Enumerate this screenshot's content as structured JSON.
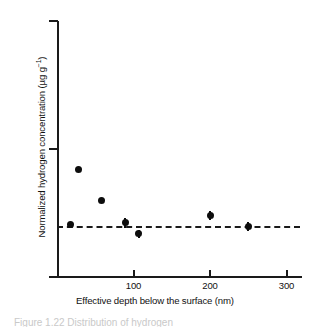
{
  "figure": {
    "caption_fragment": "Figure 1.22 Distribution of hydrogen"
  },
  "axes": {
    "y_ticks": [
      {
        "label_base": "10",
        "label_exp": "2",
        "value": 100
      },
      {
        "label_base": "10",
        "label_exp": "3",
        "value": 1000
      },
      {
        "label_base": "10",
        "label_exp": "4",
        "value": 10000
      }
    ],
    "x_ticks": [
      {
        "label": "100",
        "value": 100
      },
      {
        "label": "200",
        "value": 200
      },
      {
        "label": "300",
        "value": 300
      }
    ]
  },
  "chart_data": {
    "type": "scatter",
    "title": "",
    "xlabel": "Effective depth below the surface (nm)",
    "ylabel": "Normalized hydrogen concentration (µg g⁻¹)",
    "ylabel_text": "Normalized hydrogen concentration (µg g",
    "ylabel_sup": "−1",
    "ylabel_tail": ")",
    "xlim": [
      0,
      320
    ],
    "ylim": [
      100,
      10000
    ],
    "yscale": "log",
    "xscale": "linear",
    "grid": false,
    "legend": null,
    "series": [
      {
        "name": "Normalized hydrogen concentration",
        "marker": "filled-circle",
        "color": "#0d0d0d",
        "points": [
          {
            "x": 18,
            "y": 255,
            "yerr": 0
          },
          {
            "x": 28,
            "y": 690,
            "yerr": 0
          },
          {
            "x": 58,
            "y": 395,
            "yerr": 0
          },
          {
            "x": 89,
            "y": 265,
            "yerr": 22
          },
          {
            "x": 107,
            "y": 218,
            "yerr": 15
          },
          {
            "x": 200,
            "y": 305,
            "yerr": 25
          },
          {
            "x": 250,
            "y": 250,
            "yerr": 20
          }
        ]
      }
    ],
    "reference_line": {
      "type": "horizontal-dashed",
      "y": 250,
      "x_start": 0,
      "x_end": 318,
      "color": "#1a1a1a"
    }
  }
}
